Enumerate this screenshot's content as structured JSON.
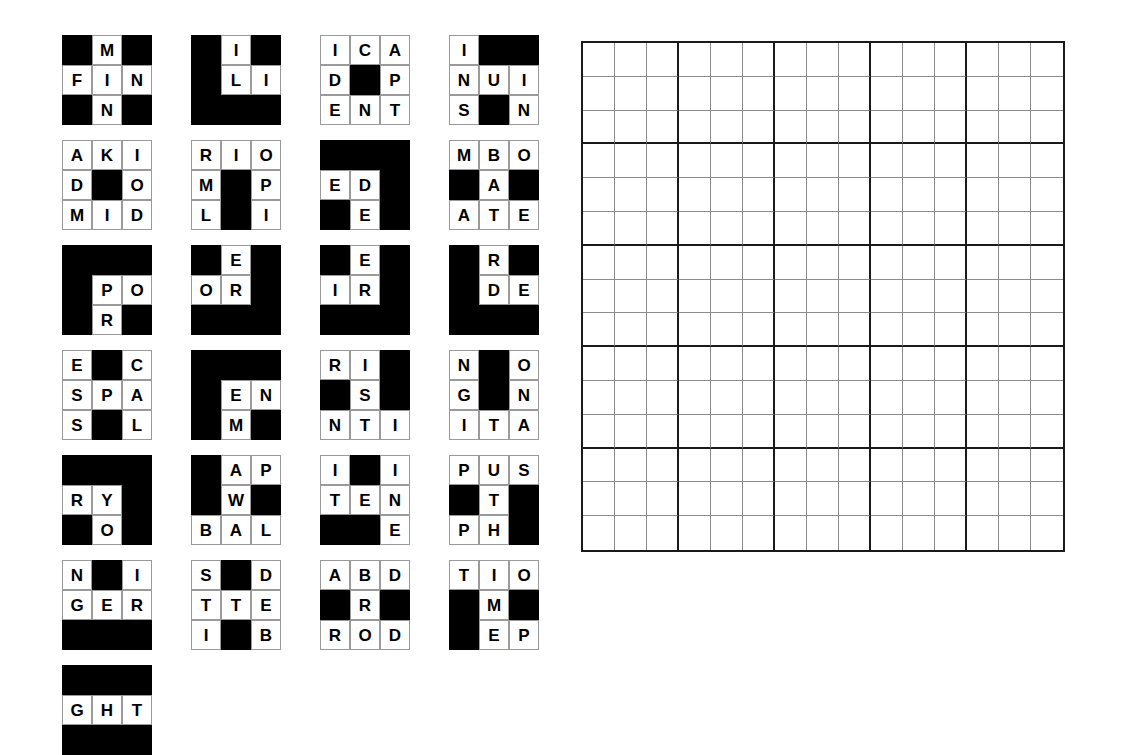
{
  "puzzle": {
    "type": "crossword-piece-assembly",
    "piece_rows": 7,
    "piece_cols": 4,
    "piece_size": 3,
    "blank_char": "",
    "colors": {
      "block": "#000000",
      "letter_cell": "#ffffff",
      "letter_text": "#000000",
      "grid_thin_line": "#8c8c8c",
      "grid_thick_line": "#1a1a1a",
      "page_background": "#ffffff"
    },
    "pieces": [
      {
        "id": "piece-1",
        "row": 0,
        "col": 0,
        "grid": [
          [
            "",
            "M",
            ""
          ],
          [
            "F",
            "I",
            "N"
          ],
          [
            "",
            "N",
            ""
          ]
        ]
      },
      {
        "id": "piece-2",
        "row": 0,
        "col": 1,
        "grid": [
          [
            "",
            "I",
            ""
          ],
          [
            "",
            "L",
            "I"
          ],
          [
            "",
            "",
            ""
          ]
        ]
      },
      {
        "id": "piece-3",
        "row": 0,
        "col": 2,
        "grid": [
          [
            "I",
            "C",
            "A"
          ],
          [
            "D",
            "",
            "P"
          ],
          [
            "E",
            "N",
            "T"
          ]
        ]
      },
      {
        "id": "piece-4",
        "row": 0,
        "col": 3,
        "grid": [
          [
            "I",
            "",
            ""
          ],
          [
            "N",
            "U",
            "I"
          ],
          [
            "S",
            "",
            "N"
          ]
        ]
      },
      {
        "id": "piece-5",
        "row": 1,
        "col": 0,
        "grid": [
          [
            "A",
            "K",
            "I"
          ],
          [
            "D",
            "",
            "O"
          ],
          [
            "M",
            "I",
            "D"
          ]
        ]
      },
      {
        "id": "piece-6",
        "row": 1,
        "col": 1,
        "grid": [
          [
            "R",
            "I",
            "O"
          ],
          [
            "M",
            "",
            "P"
          ],
          [
            "L",
            "",
            "I"
          ]
        ]
      },
      {
        "id": "piece-7",
        "row": 1,
        "col": 2,
        "grid": [
          [
            "",
            "",
            ""
          ],
          [
            "E",
            "D",
            ""
          ],
          [
            "",
            "E",
            ""
          ]
        ]
      },
      {
        "id": "piece-8",
        "row": 1,
        "col": 3,
        "grid": [
          [
            "M",
            "B",
            "O"
          ],
          [
            "",
            "A",
            ""
          ],
          [
            "A",
            "T",
            "E"
          ]
        ]
      },
      {
        "id": "piece-9",
        "row": 2,
        "col": 0,
        "grid": [
          [
            "",
            "",
            ""
          ],
          [
            "",
            "P",
            "O"
          ],
          [
            "",
            "R",
            ""
          ]
        ]
      },
      {
        "id": "piece-10",
        "row": 2,
        "col": 1,
        "grid": [
          [
            "",
            "E",
            ""
          ],
          [
            "O",
            "R",
            ""
          ],
          [
            "",
            "",
            ""
          ]
        ]
      },
      {
        "id": "piece-11",
        "row": 2,
        "col": 2,
        "grid": [
          [
            "",
            "E",
            ""
          ],
          [
            "I",
            "R",
            ""
          ],
          [
            "",
            "",
            ""
          ]
        ]
      },
      {
        "id": "piece-12",
        "row": 2,
        "col": 3,
        "grid": [
          [
            "",
            "R",
            ""
          ],
          [
            "",
            "D",
            "E"
          ],
          [
            "",
            "",
            ""
          ]
        ]
      },
      {
        "id": "piece-13",
        "row": 3,
        "col": 0,
        "grid": [
          [
            "E",
            "",
            "C"
          ],
          [
            "S",
            "P",
            "A"
          ],
          [
            "S",
            "",
            "L"
          ]
        ]
      },
      {
        "id": "piece-14",
        "row": 3,
        "col": 1,
        "grid": [
          [
            "",
            "",
            ""
          ],
          [
            "",
            "E",
            "N"
          ],
          [
            "",
            "M",
            ""
          ]
        ]
      },
      {
        "id": "piece-15",
        "row": 3,
        "col": 2,
        "grid": [
          [
            "R",
            "I",
            ""
          ],
          [
            "",
            "S",
            ""
          ],
          [
            "N",
            "T",
            "I"
          ]
        ]
      },
      {
        "id": "piece-16",
        "row": 3,
        "col": 3,
        "grid": [
          [
            "N",
            "",
            "O"
          ],
          [
            "G",
            "",
            "N"
          ],
          [
            "I",
            "T",
            "A"
          ]
        ]
      },
      {
        "id": "piece-17",
        "row": 4,
        "col": 0,
        "grid": [
          [
            "",
            "",
            ""
          ],
          [
            "R",
            "Y",
            ""
          ],
          [
            "",
            "O",
            ""
          ]
        ]
      },
      {
        "id": "piece-18",
        "row": 4,
        "col": 1,
        "grid": [
          [
            "",
            "A",
            "P"
          ],
          [
            "",
            "W",
            ""
          ],
          [
            "B",
            "A",
            "L"
          ]
        ]
      },
      {
        "id": "piece-19",
        "row": 4,
        "col": 2,
        "grid": [
          [
            "I",
            "",
            "I"
          ],
          [
            "T",
            "E",
            "N"
          ],
          [
            "",
            "",
            "E"
          ]
        ]
      },
      {
        "id": "piece-20",
        "row": 4,
        "col": 3,
        "grid": [
          [
            "P",
            "U",
            "S"
          ],
          [
            "",
            "T",
            ""
          ],
          [
            "P",
            "H",
            ""
          ]
        ]
      },
      {
        "id": "piece-21",
        "row": 5,
        "col": 0,
        "grid": [
          [
            "N",
            "",
            "I"
          ],
          [
            "G",
            "E",
            "R"
          ],
          [
            "",
            "",
            ""
          ]
        ]
      },
      {
        "id": "piece-22",
        "row": 5,
        "col": 1,
        "grid": [
          [
            "S",
            "",
            "D"
          ],
          [
            "T",
            "T",
            "E"
          ],
          [
            "I",
            "",
            "B"
          ]
        ]
      },
      {
        "id": "piece-23",
        "row": 5,
        "col": 2,
        "grid": [
          [
            "A",
            "B",
            "D"
          ],
          [
            "",
            "R",
            ""
          ],
          [
            "R",
            "O",
            "D"
          ]
        ]
      },
      {
        "id": "piece-24",
        "row": 5,
        "col": 3,
        "grid": [
          [
            "T",
            "I",
            "O"
          ],
          [
            "",
            "M",
            ""
          ],
          [
            "",
            "E",
            "P"
          ]
        ]
      },
      {
        "id": "piece-25",
        "row": 6,
        "col": 0,
        "grid": [
          [
            "",
            "",
            ""
          ],
          [
            "G",
            "H",
            "T"
          ],
          [
            "",
            "",
            ""
          ]
        ]
      }
    ]
  },
  "answer_grid": {
    "name": "answer-grid",
    "rows": 15,
    "cols": 15,
    "block_size": 3,
    "cells": []
  }
}
